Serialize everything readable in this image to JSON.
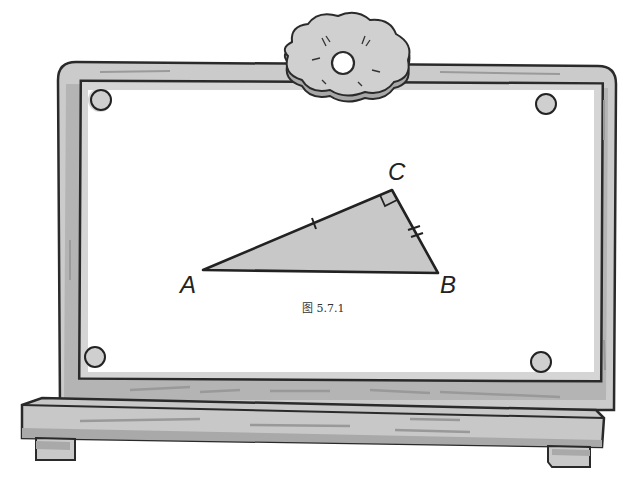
{
  "figure": {
    "caption": "图 5.7.1",
    "vertices": {
      "A": {
        "label": "A",
        "x": 203,
        "y": 270
      },
      "B": {
        "label": "B",
        "x": 438,
        "y": 273
      },
      "C": {
        "label": "C",
        "x": 392,
        "y": 190
      }
    },
    "right_angle_at": "C",
    "tick_marks": {
      "AC": 1,
      "CB": 2
    },
    "fill_color": "#c8c8c8",
    "stroke_color": "#222222"
  },
  "board": {
    "frame_color": "#c9c9c9",
    "frame_shadow": "#a8a8a8",
    "outline_color": "#2a2a2a",
    "ornament": "flower-ornament"
  }
}
